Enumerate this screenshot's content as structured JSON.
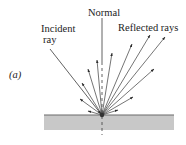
{
  "labels": {
    "normal": "Normal",
    "incident_line1": "Incident",
    "incident_line2": "ray",
    "reflected": "Reflected rays",
    "panel": "(a)"
  },
  "colors": {
    "ray": "#3a3a3a",
    "surface_fill": "#c8c8c8",
    "surface_edge": "#6a6a6a",
    "text": "#222222"
  },
  "geometry": {
    "reflection_point": [
      102,
      115
    ],
    "surface": {
      "x": 44,
      "y": 115,
      "width": 130,
      "height": 15
    },
    "normal": {
      "x": 102,
      "y_top": 10,
      "y_bottom": 135
    },
    "incident_start": [
      50,
      49
    ],
    "reflected_tips": [
      [
        88,
        111
      ],
      [
        80,
        99
      ],
      [
        82,
        83
      ],
      [
        88,
        69
      ],
      [
        97,
        60
      ],
      [
        112,
        53
      ],
      [
        132,
        44
      ],
      [
        150,
        35
      ],
      [
        165,
        37
      ],
      [
        154,
        69
      ],
      [
        133,
        97
      ],
      [
        118,
        110
      ]
    ]
  }
}
